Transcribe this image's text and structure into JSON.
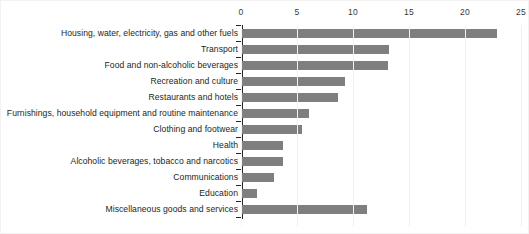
{
  "chart_data": {
    "type": "bar",
    "orientation": "horizontal",
    "title": "",
    "subtitle": "",
    "xlabel": "",
    "ylabel": "",
    "xlim": [
      0,
      25
    ],
    "ylim": null,
    "grid": true,
    "legend": null,
    "legend_position": "none",
    "x_ticks": [
      0,
      5,
      10,
      15,
      20,
      25
    ],
    "x_tick_labels": [
      "0",
      "5",
      "10",
      "15",
      "20",
      "25"
    ],
    "axis_position": "top",
    "series_color": "#7f7f7f",
    "categories": [
      "Housing, water, electricity, gas and other fuels",
      "Transport",
      "Food and non-alcoholic beverages",
      "Recreation and culture",
      "Restaurants and hotels",
      "Furnishings, household equipment and routine maintenance",
      "Clothing and footwear",
      "Health",
      "Alcoholic beverages, tobacco and narcotics",
      "Communications",
      "Education",
      "Miscellaneous goods and services"
    ],
    "values": [
      22.8,
      13.1,
      13.0,
      9.2,
      8.6,
      6.0,
      5.4,
      3.7,
      3.7,
      2.9,
      1.3,
      11.2
    ]
  }
}
